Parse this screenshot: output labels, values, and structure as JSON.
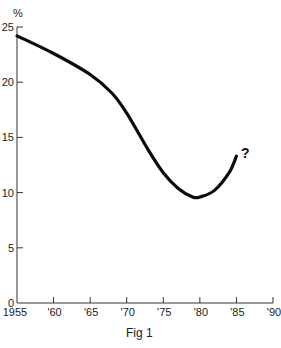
{
  "chart_data": {
    "type": "line",
    "title": "",
    "caption": "Fig 1",
    "xlabel": "",
    "ylabel": "%",
    "xlim": [
      1955,
      1990
    ],
    "ylim": [
      0,
      25
    ],
    "grid": false,
    "legend": null,
    "x_ticks": [
      "1955",
      "'60",
      "'65",
      "'70",
      "'75",
      "'80",
      "'85",
      "'90"
    ],
    "x_tick_values": [
      1955,
      1960,
      1965,
      1970,
      1975,
      1980,
      1985,
      1990
    ],
    "y_ticks": [
      "0",
      "5",
      "10",
      "15",
      "20",
      "25"
    ],
    "y_tick_values": [
      0,
      5,
      10,
      15,
      20,
      25
    ],
    "series": [
      {
        "name": "percentage",
        "x": [
          1955,
          1960,
          1965,
          1968,
          1970,
          1973,
          1975,
          1977,
          1979,
          1980,
          1982,
          1984,
          1985
        ],
        "values": [
          24.2,
          22.6,
          20.7,
          19.0,
          17.2,
          13.8,
          11.8,
          10.4,
          9.6,
          9.6,
          10.2,
          11.8,
          13.3
        ]
      }
    ],
    "annotations": [
      {
        "text": "?",
        "x": 1985.5,
        "y": 13.8
      }
    ]
  }
}
